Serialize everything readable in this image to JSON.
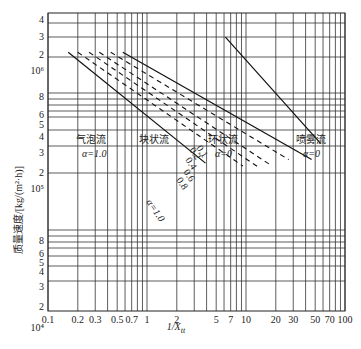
{
  "chart_data": {
    "type": "line",
    "title": "",
    "xlabel": "1/X_tt",
    "ylabel": "质量速度/[kg/(m²·h)]",
    "xscale": "log",
    "yscale": "log",
    "xlim": [
      0.1,
      100
    ],
    "ylim": [
      10000,
      4500000
    ],
    "grid": true,
    "x_ticks": [
      "0.1",
      "0.2",
      "0.3",
      "0.5",
      "0.7",
      "1",
      "2",
      "5",
      "7",
      "10",
      "20",
      "30",
      "50",
      "70",
      "100"
    ],
    "x_tick_values": [
      0.1,
      0.2,
      0.3,
      0.5,
      0.7,
      1,
      2,
      5,
      7,
      10,
      20,
      30,
      50,
      70,
      100
    ],
    "y_ticks": [
      {
        "label": "4",
        "value": 4000000
      },
      {
        "label": "3",
        "value": 3000000
      },
      {
        "label": "2",
        "value": 2000000
      },
      {
        "label": "10⁶",
        "value": 1000000
      },
      {
        "label": "8",
        "value": 800000
      },
      {
        "label": "6",
        "value": 600000
      },
      {
        "label": "5",
        "value": 500000
      },
      {
        "label": "4",
        "value": 400000
      },
      {
        "label": "3",
        "value": 300000
      },
      {
        "label": "2",
        "value": 200000
      },
      {
        "label": "10⁵",
        "value": 100000
      },
      {
        "label": "8",
        "value": 80000
      },
      {
        "label": "6",
        "value": 60000
      },
      {
        "label": "5",
        "value": 50000
      },
      {
        "label": "4",
        "value": 40000
      },
      {
        "label": "3",
        "value": 30000
      },
      {
        "label": "2",
        "value": 20000
      },
      {
        "label": "10⁴",
        "value": 10000
      }
    ],
    "series": [
      {
        "name": "α=1.0",
        "style": "solid",
        "label": "α=1.0",
        "points": [
          [
            0.16,
            2200000
          ],
          [
            3.9,
            290000
          ]
        ]
      },
      {
        "name": "0.8",
        "style": "dashed",
        "label": "0.8",
        "points": [
          [
            0.2,
            2200000
          ],
          [
            9.3,
            260000
          ]
        ]
      },
      {
        "name": "0.6",
        "style": "dashed",
        "label": "0.6",
        "points": [
          [
            0.26,
            2200000
          ],
          [
            13,
            255000
          ]
        ]
      },
      {
        "name": "0.4",
        "style": "dashed",
        "label": "0.4",
        "points": [
          [
            0.33,
            2200000
          ],
          [
            18,
            265000
          ]
        ]
      },
      {
        "name": "0.2",
        "style": "dashed",
        "label": "0.2",
        "points": [
          [
            0.43,
            2200000
          ],
          [
            27,
            330000
          ]
        ]
      },
      {
        "name": "0.1",
        "style": "solid",
        "label": "0.1",
        "points": [
          [
            0.57,
            2200000
          ],
          [
            46,
            330000
          ]
        ]
      },
      {
        "name": "喷雾流边界",
        "style": "solid",
        "label": "",
        "points": [
          [
            6.2,
            3000000
          ],
          [
            57,
            600000
          ]
        ]
      }
    ],
    "regions": [
      {
        "name": "气泡流",
        "alpha": "α=1.0"
      },
      {
        "name": "块状流",
        "alpha": ""
      },
      {
        "name": "环状流",
        "alpha": "α=0"
      },
      {
        "name": "喷雾流",
        "alpha": "α=0"
      }
    ]
  }
}
